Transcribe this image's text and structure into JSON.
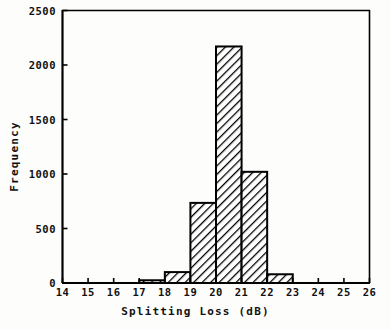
{
  "chart_data": {
    "type": "bar",
    "title": "",
    "subtitle": "",
    "xlabel": "Splitting Loss (dB)",
    "ylabel": "Frequency",
    "xlim": [
      14,
      26
    ],
    "ylim": [
      0,
      2500
    ],
    "xticks": [
      14,
      15,
      16,
      17,
      18,
      19,
      20,
      21,
      22,
      23,
      24,
      25,
      26
    ],
    "xtick_labels": [
      "14",
      "15",
      "16",
      "17",
      "18",
      "19",
      "20",
      "21",
      "22",
      "23",
      "24",
      "25",
      "26"
    ],
    "yticks": [
      0,
      500,
      1000,
      1500,
      2000,
      2500
    ],
    "ytick_labels": [
      "0",
      "500",
      "1000",
      "1500",
      "2000",
      "2500"
    ],
    "bin_width": 1,
    "grid": false,
    "legend": false,
    "bar_style": {
      "fill": "diagonal-hatch",
      "hatch_color": "#000000",
      "edge_color": "#000000",
      "face_color": "#ffffff"
    },
    "categories": [
      "14-15",
      "15-16",
      "16-17",
      "17-18",
      "18-19",
      "19-20",
      "20-21",
      "21-22",
      "22-23",
      "23-24",
      "24-25",
      "25-26"
    ],
    "bin_starts": [
      14,
      15,
      16,
      17,
      18,
      19,
      20,
      21,
      22,
      23,
      24,
      25
    ],
    "values": [
      0,
      0,
      0,
      25,
      100,
      735,
      2170,
      1020,
      80,
      0,
      0,
      0
    ]
  },
  "annotations": {
    "axis_color": "#000000",
    "background": "#fdfdfc"
  }
}
